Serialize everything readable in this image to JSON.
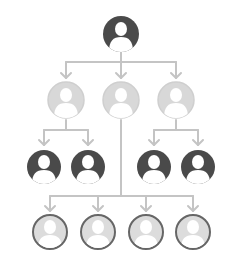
{
  "diagram": {
    "type": "org-chart",
    "colors": {
      "line": "#c4c4c4",
      "dark_fill": "#4a4a4a",
      "light_fill": "#d8d8d8",
      "light_ring": "#cfcfcf",
      "outline_ring": "#666666",
      "figure": "#ffffff"
    },
    "levels": [
      {
        "level": 1,
        "style": "dark",
        "nodes": [
          {
            "id": "root",
            "cx": 121,
            "cy": 34,
            "r": 18
          }
        ]
      },
      {
        "level": 2,
        "style": "light",
        "nodes": [
          {
            "id": "l2-a",
            "cx": 66,
            "cy": 100,
            "r": 18
          },
          {
            "id": "l2-b",
            "cx": 121,
            "cy": 100,
            "r": 18
          },
          {
            "id": "l2-c",
            "cx": 176,
            "cy": 100,
            "r": 18
          }
        ]
      },
      {
        "level": 3,
        "style": "dark",
        "nodes": [
          {
            "id": "l3-a",
            "cx": 44,
            "cy": 167,
            "r": 17
          },
          {
            "id": "l3-b",
            "cx": 88,
            "cy": 167,
            "r": 17
          },
          {
            "id": "l3-c",
            "cx": 154,
            "cy": 167,
            "r": 17
          },
          {
            "id": "l3-d",
            "cx": 198,
            "cy": 167,
            "r": 17
          }
        ]
      },
      {
        "level": 4,
        "style": "outlined",
        "nodes": [
          {
            "id": "l4-a",
            "cx": 50,
            "cy": 232,
            "r": 17
          },
          {
            "id": "l4-b",
            "cx": 98,
            "cy": 232,
            "r": 17
          },
          {
            "id": "l4-c",
            "cx": 146,
            "cy": 232,
            "r": 17
          },
          {
            "id": "l4-d",
            "cx": 193,
            "cy": 232,
            "r": 17
          }
        ]
      }
    ]
  }
}
